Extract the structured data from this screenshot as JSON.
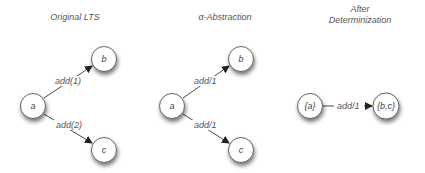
{
  "panels": [
    {
      "title": "Original LTS",
      "nodes": [
        {
          "id": "a",
          "label": "a"
        },
        {
          "id": "b",
          "label": "b"
        },
        {
          "id": "c",
          "label": "c"
        }
      ],
      "edges": [
        {
          "from": "a",
          "to": "b",
          "label": "add(1)"
        },
        {
          "from": "a",
          "to": "c",
          "label": "add(2)"
        }
      ]
    },
    {
      "title": "α-Abstraction",
      "nodes": [
        {
          "id": "a",
          "label": "a"
        },
        {
          "id": "b",
          "label": "b"
        },
        {
          "id": "c",
          "label": "c"
        }
      ],
      "edges": [
        {
          "from": "a",
          "to": "b",
          "label": "add/1"
        },
        {
          "from": "a",
          "to": "c",
          "label": "add/1"
        }
      ]
    },
    {
      "title_line1": "After",
      "title_line2": "Determinization",
      "nodes": [
        {
          "id": "a",
          "label": "{a}"
        },
        {
          "id": "bc",
          "label": "{b,c}"
        }
      ],
      "edges": [
        {
          "from": "a",
          "to": "bc",
          "label": "add/1"
        }
      ]
    }
  ],
  "colors": {
    "node_stroke": "#555555",
    "node_fill": "#ffffff",
    "edge": "#333333",
    "text": "#555555"
  }
}
